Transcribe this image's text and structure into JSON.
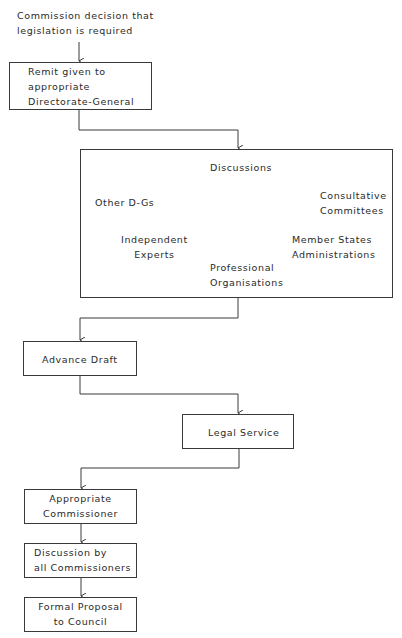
{
  "diagram": {
    "type": "flowchart",
    "start_label": [
      "Commission decision that",
      "legislation is required"
    ],
    "steps": [
      {
        "id": "remit",
        "lines": [
          "Remit given to",
          "appropriate",
          "Directorate-General"
        ]
      },
      {
        "id": "discussions",
        "title": "Discussions",
        "participants": [
          {
            "lines": [
              "Other D-Gs"
            ]
          },
          {
            "lines": [
              "Independent",
              "Experts"
            ]
          },
          {
            "lines": [
              "Professional",
              "Organisations"
            ]
          },
          {
            "lines": [
              "Member States",
              "Administrations"
            ]
          },
          {
            "lines": [
              "Consultative",
              "Committees"
            ]
          }
        ]
      },
      {
        "id": "advance_draft",
        "lines": [
          "Advance Draft"
        ]
      },
      {
        "id": "legal_service",
        "lines": [
          "Legal Service"
        ]
      },
      {
        "id": "appropriate_commissioner",
        "lines": [
          "Appropriate",
          "Commissioner"
        ]
      },
      {
        "id": "discussion_all",
        "lines": [
          "Discussion by",
          "all Commissioners"
        ]
      },
      {
        "id": "formal_proposal",
        "lines": [
          "Formal Proposal",
          "to Council"
        ]
      }
    ]
  },
  "colors": {
    "line": "#3a3a3a",
    "text": "#2a2a2a",
    "background": "#ffffff"
  }
}
